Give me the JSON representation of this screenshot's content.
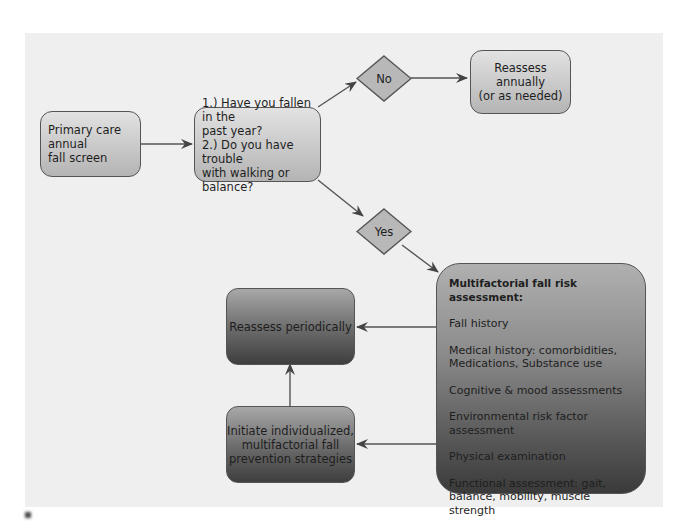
{
  "diagram": {
    "type": "flowchart",
    "nodes": {
      "start": {
        "label": "Primary care annual fall screen",
        "lines": [
          "Primary care annual",
          "fall screen"
        ]
      },
      "questions": {
        "lines": [
          "1.) Have you fallen in the",
          "past year?",
          "2.) Do you have trouble",
          "with walking or balance?"
        ]
      },
      "no_decision": {
        "label": "No"
      },
      "yes_decision": {
        "label": "Yes"
      },
      "reassess_annually": {
        "lines": [
          "Reassess annually",
          "(or as needed)"
        ]
      },
      "assessment": {
        "title": "Multifactorial fall risk assessment:",
        "items": [
          "Fall history",
          "Medical history: comorbidities, Medications, Substance use",
          "Cognitive & mood assessments",
          "Environmental risk factor assessment",
          "Physical examination",
          "Functional assessment: gait, balance, mobility, muscle strength"
        ]
      },
      "reassess_periodically": {
        "label": "Reassess periodically"
      },
      "initiate_strategies": {
        "lines": [
          "Initiate individualized,",
          "multifactorial fall",
          "prevention strategies"
        ]
      }
    },
    "edges": [
      {
        "from": "start",
        "to": "questions"
      },
      {
        "from": "questions",
        "to": "no_decision"
      },
      {
        "from": "no_decision",
        "to": "reassess_annually"
      },
      {
        "from": "questions",
        "to": "yes_decision"
      },
      {
        "from": "yes_decision",
        "to": "assessment"
      },
      {
        "from": "assessment",
        "to": "reassess_periodically"
      },
      {
        "from": "assessment",
        "to": "initiate_strategies"
      },
      {
        "from": "initiate_strategies",
        "to": "reassess_periodically"
      }
    ],
    "colors": {
      "panel_bg": "#efefef",
      "light_box_top": "#e2e2e2",
      "light_box_bottom": "#b4b4b4",
      "dark_box_top": "#a8a8a8",
      "dark_box_bottom": "#3e3e3e",
      "stroke": "#555555"
    }
  }
}
